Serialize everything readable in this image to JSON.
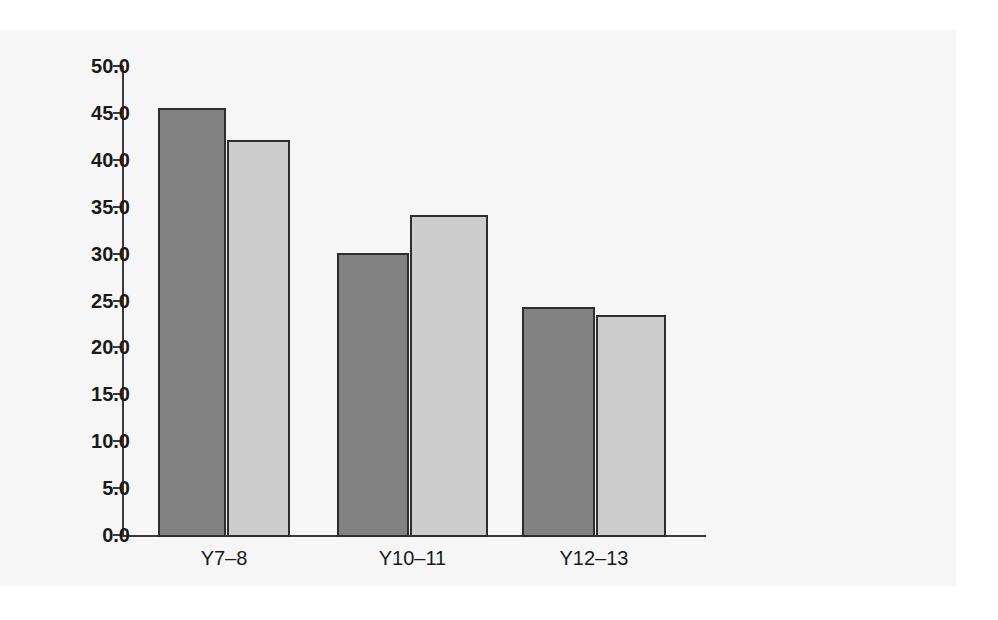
{
  "chart_data": {
    "type": "bar",
    "title": "",
    "subtitle": "",
    "xlabel": "",
    "ylabel": "",
    "categories": [
      "Y7–8",
      "Y10–11",
      "Y12–13"
    ],
    "series": [
      {
        "name": "series-a",
        "color": "#828282",
        "values": [
          45.7,
          30.3,
          24.5
        ]
      },
      {
        "name": "series-b",
        "color": "#cdcdcd",
        "values": [
          42.3,
          34.3,
          23.7
        ]
      }
    ],
    "ylim": [
      0.0,
      50.0
    ],
    "ytick_step": 5.0,
    "ytick_labels": [
      "0.0",
      "5.0",
      "10.0",
      "15.0",
      "20.0",
      "25.0",
      "30.0",
      "35.0",
      "40.0",
      "45.0",
      "50.0"
    ],
    "ytick_values": [
      0.0,
      5.0,
      10.0,
      15.0,
      20.0,
      25.0,
      30.0,
      35.0,
      40.0,
      45.0,
      50.0
    ],
    "grid": false,
    "legend": null,
    "legend_position": "none",
    "annotations": [],
    "bar_edge_color": "#2e2e2e",
    "panel_color": "#f6f6f6",
    "axis_color": "#3a3a3a"
  }
}
